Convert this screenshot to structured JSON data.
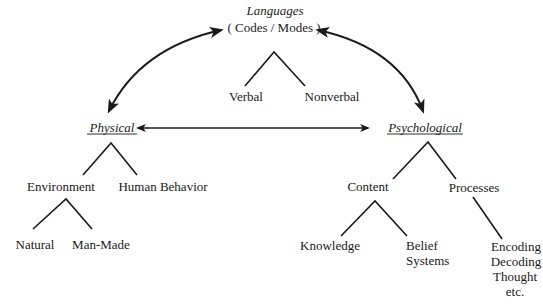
{
  "diagram": {
    "root": {
      "title": "Languages",
      "subtitle": "( Codes / Modes )",
      "children": [
        "Verbal",
        "Nonverbal"
      ]
    },
    "physical": {
      "title": "Physical",
      "children": {
        "environment": {
          "label": "Environment",
          "children": [
            "Natural",
            "Man-Made"
          ]
        },
        "human_behavior": {
          "label": "Human Behavior"
        }
      }
    },
    "psychological": {
      "title": "Psychological",
      "children": {
        "content": {
          "label": "Content",
          "children": [
            "Knowledge",
            "Belief",
            "Systems"
          ]
        },
        "processes": {
          "label": "Processes",
          "children": [
            "Encoding",
            "Decoding",
            "Thought",
            "etc."
          ]
        }
      }
    },
    "relations": [
      {
        "from": "Languages",
        "to": "Physical",
        "type": "bidirectional"
      },
      {
        "from": "Languages",
        "to": "Psychological",
        "type": "bidirectional"
      },
      {
        "from": "Physical",
        "to": "Psychological",
        "type": "bidirectional"
      }
    ]
  }
}
